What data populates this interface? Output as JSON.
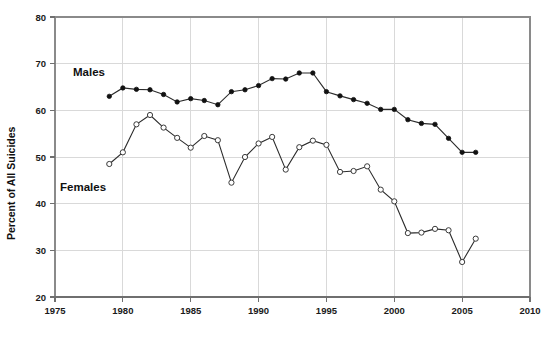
{
  "chart_data": {
    "type": "line",
    "title": "",
    "xlabel": "",
    "ylabel": "Percent of All Suicides",
    "xlim": [
      1975,
      2010
    ],
    "ylim": [
      20,
      80
    ],
    "xticks": [
      1975,
      1980,
      1985,
      1990,
      1995,
      2000,
      2005,
      2010
    ],
    "yticks": [
      20,
      30,
      40,
      50,
      60,
      70,
      80
    ],
    "grid": true,
    "legend_position": "inline-annotation",
    "annotations": [
      {
        "text": "Males",
        "x": 1980.5,
        "y": 70.5
      },
      {
        "text": "Females",
        "x": 1979.5,
        "y": 45.0
      }
    ],
    "series": [
      {
        "name": "Males",
        "marker": "filled-circle",
        "color": "#111111",
        "x": [
          1979,
          1980,
          1981,
          1982,
          1983,
          1984,
          1985,
          1986,
          1987,
          1988,
          1989,
          1990,
          1991,
          1992,
          1993,
          1994,
          1995,
          1996,
          1997,
          1998,
          1999,
          2000,
          2001,
          2002,
          2003,
          2004,
          2005,
          2006
        ],
        "values": [
          63.0,
          64.8,
          64.5,
          64.4,
          63.4,
          61.8,
          62.5,
          62.1,
          61.2,
          64.0,
          64.4,
          65.3,
          66.8,
          66.7,
          68.0,
          68.0,
          64.0,
          63.1,
          62.3,
          61.5,
          60.2,
          60.2,
          58.0,
          57.2,
          57.0,
          54.0,
          51.0,
          51.0
        ]
      },
      {
        "name": "Females",
        "marker": "open-circle",
        "color": "#3a3a3a",
        "x": [
          1979,
          1980,
          1981,
          1982,
          1983,
          1984,
          1985,
          1986,
          1987,
          1988,
          1989,
          1990,
          1991,
          1992,
          1993,
          1994,
          1995,
          1996,
          1997,
          1998,
          1999,
          2000,
          2001,
          2002,
          2003,
          2004,
          2005,
          2006
        ],
        "values": [
          48.5,
          51.0,
          57.0,
          59.0,
          56.3,
          54.1,
          52.0,
          54.5,
          53.6,
          44.5,
          50.0,
          52.9,
          54.3,
          47.3,
          52.1,
          53.5,
          52.6,
          46.8,
          47.0,
          48.0,
          43.0,
          40.5,
          33.7,
          33.8,
          34.6,
          34.3,
          27.5,
          32.5
        ]
      }
    ]
  },
  "axis": {
    "y_title": "Percent of All Suicides",
    "x_tick_labels": [
      "1975",
      "1980",
      "1985",
      "1990",
      "1995",
      "2000",
      "2005",
      "2010"
    ],
    "y_tick_labels": [
      "20",
      "30",
      "40",
      "50",
      "60",
      "70",
      "80"
    ]
  },
  "labels": {
    "males": "Males",
    "females": "Females"
  },
  "colors": {
    "background": "#ffffff",
    "grid": "#d9d9d9",
    "frame": "#8a8a8a",
    "males_marker": "#111111",
    "females_marker": "#3a3a3a",
    "line": "#2b2b2b",
    "text": "#101010"
  }
}
